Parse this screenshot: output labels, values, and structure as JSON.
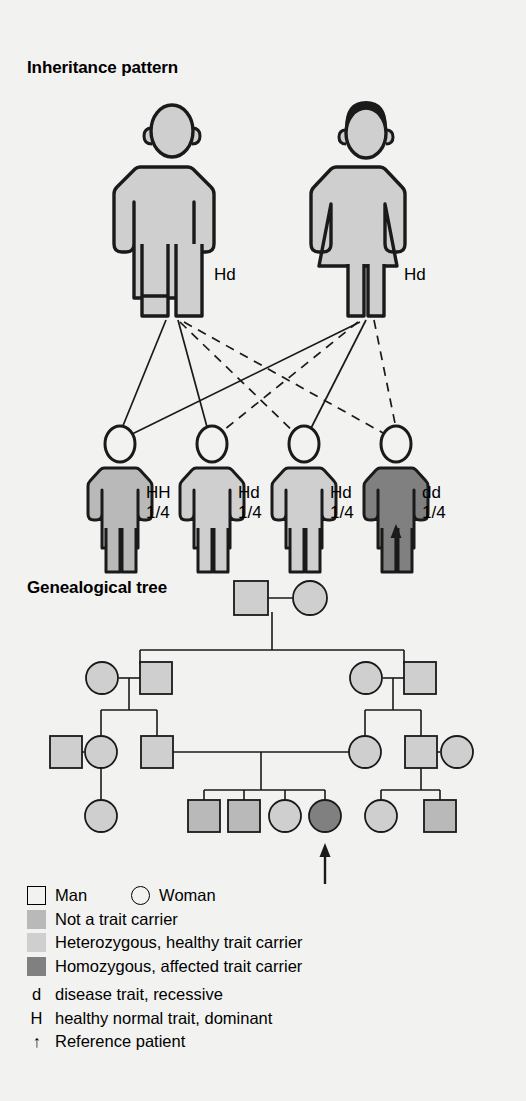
{
  "sections": {
    "inheritance_title": "Inheritance pattern",
    "genealogy_title": "Genealogical tree"
  },
  "colors": {
    "background": "#f2f2f0",
    "stroke": "#1a1a1a",
    "not_carrier": "#b9b9b9",
    "heterozygous": "#cfcfcf",
    "homozygous_affected": "#808080",
    "unfilled": "#f2f2f0"
  },
  "inheritance": {
    "parents": [
      {
        "sex": "male",
        "genotype": "Hd",
        "fill": "heterozygous"
      },
      {
        "sex": "female",
        "genotype": "Hd",
        "fill": "heterozygous"
      }
    ],
    "children": [
      {
        "genotype": "HH",
        "ratio": "1/4",
        "fill": "not_carrier",
        "arrow": false
      },
      {
        "genotype": "Hd",
        "ratio": "1/4",
        "fill": "heterozygous",
        "arrow": false
      },
      {
        "genotype": "Hd",
        "ratio": "1/4",
        "fill": "heterozygous",
        "arrow": false
      },
      {
        "genotype": "dd",
        "ratio": "1/4",
        "fill": "homozygous_affected",
        "arrow": true
      }
    ],
    "line_styles": {
      "father_allele": "solid",
      "mother_allele": "dashed"
    }
  },
  "pedigree": {
    "generations": [
      {
        "level": "I",
        "members": [
          {
            "sex": "male",
            "fill": "heterozygous"
          },
          {
            "sex": "female",
            "fill": "heterozygous"
          }
        ]
      },
      {
        "level": "II",
        "members": [
          {
            "sex": "female",
            "fill": "heterozygous"
          },
          {
            "sex": "male",
            "fill": "heterozygous"
          },
          {
            "sex": "female",
            "fill": "heterozygous"
          },
          {
            "sex": "male",
            "fill": "heterozygous"
          }
        ]
      },
      {
        "level": "III",
        "members": [
          {
            "sex": "male",
            "fill": "heterozygous"
          },
          {
            "sex": "female",
            "fill": "heterozygous"
          },
          {
            "sex": "male",
            "fill": "heterozygous"
          },
          {
            "sex": "female",
            "fill": "heterozygous"
          },
          {
            "sex": "male",
            "fill": "heterozygous"
          },
          {
            "sex": "female",
            "fill": "heterozygous"
          }
        ]
      },
      {
        "level": "IV",
        "members": [
          {
            "sex": "female",
            "fill": "heterozygous",
            "arrow": false
          },
          {
            "sex": "male",
            "fill": "not_carrier",
            "arrow": false
          },
          {
            "sex": "male",
            "fill": "not_carrier",
            "arrow": false
          },
          {
            "sex": "female",
            "fill": "heterozygous",
            "arrow": false
          },
          {
            "sex": "female",
            "fill": "homozygous_affected",
            "arrow": true
          },
          {
            "sex": "female",
            "fill": "heterozygous",
            "arrow": false
          },
          {
            "sex": "male",
            "fill": "not_carrier",
            "arrow": false
          }
        ]
      }
    ]
  },
  "legend": {
    "row_man_woman": {
      "man_label": "Man",
      "woman_label": "Woman",
      "man_icon": "square-outline-icon",
      "woman_icon": "circle-outline-icon"
    },
    "items": [
      {
        "swatch": "not_carrier",
        "label": "Not a trait carrier"
      },
      {
        "swatch": "heterozygous",
        "label": "Heterozygous, healthy trait carrier"
      },
      {
        "swatch": "homozygous_affected",
        "label": "Homozygous, affected trait carrier"
      }
    ],
    "keys": [
      {
        "key": "d",
        "label": "disease trait, recessive"
      },
      {
        "key": "H",
        "label": "healthy normal trait, dominant"
      },
      {
        "key": "↑",
        "label": "Reference patient"
      }
    ]
  }
}
